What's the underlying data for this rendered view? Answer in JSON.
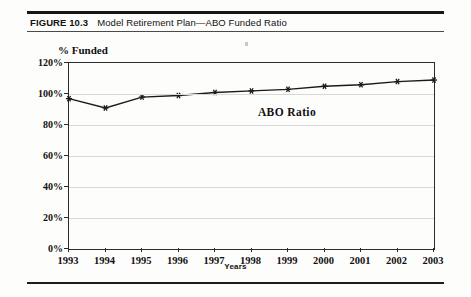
{
  "figure": {
    "label": "FIGURE 10.3",
    "title": "Model Retirement Plan—ABO Funded Ratio"
  },
  "chart_data": {
    "type": "line",
    "title": "Model Retirement Plan—ABO Funded Ratio",
    "xlabel": "Years",
    "ylabel": "% Funded",
    "categories": [
      "1993",
      "1994",
      "1995",
      "1996",
      "1997",
      "1998",
      "1999",
      "2000",
      "2001",
      "2002",
      "2003"
    ],
    "series": [
      {
        "name": "ABO Ratio",
        "values": [
          97,
          91,
          98,
          99,
          101,
          102,
          103,
          105,
          106,
          108,
          109
        ]
      }
    ],
    "ylim": [
      0,
      120
    ],
    "ytick_labels": [
      "0%",
      "20%",
      "40%",
      "60%",
      "80%",
      "100%",
      "120%"
    ],
    "ytick_values": [
      0,
      20,
      40,
      60,
      80,
      100,
      120
    ],
    "grid": true,
    "legend_position": "none",
    "annotations": [
      {
        "text": "ABO Ratio",
        "x": "1999",
        "y": 88
      }
    ],
    "marker": "asterisk",
    "line_color": "#1a1a1a",
    "grid_color": "#d8d8d8"
  }
}
